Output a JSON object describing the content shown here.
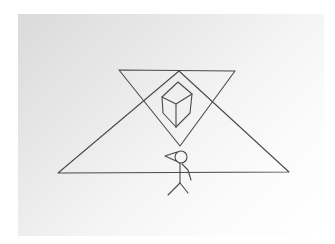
{
  "image": {
    "description": "Hand-drawn pencil sketch on paper",
    "width": 335,
    "height": 244,
    "colors": {
      "background": "#ffffff",
      "paper_shadow": "#dadada",
      "pencil": "#4a4a4a"
    },
    "elements": {
      "large_triangle": {
        "points": [
          [
            58,
            173
          ],
          [
            179,
            71
          ],
          [
            289,
            172
          ]
        ]
      },
      "inverted_triangle": {
        "points": [
          [
            119,
            70
          ],
          [
            235,
            71
          ],
          [
            180,
            146
          ]
        ]
      },
      "inner_diamond": {
        "points": [
          [
            179,
            71
          ],
          [
            211,
            101
          ],
          [
            180,
            146
          ],
          [
            137,
            101
          ]
        ]
      },
      "cube": {
        "top": [
          [
            178,
            82
          ],
          [
            192,
            94
          ],
          [
            176,
            104
          ],
          [
            162,
            97
          ]
        ],
        "left_face": [
          [
            162,
            97
          ],
          [
            176,
            104
          ],
          [
            176,
            127
          ],
          [
            163,
            113
          ]
        ],
        "right_face": [
          [
            176,
            104
          ],
          [
            192,
            94
          ],
          [
            190,
            113
          ],
          [
            176,
            127
          ]
        ]
      },
      "stick_figure": {
        "head": {
          "cx": 181,
          "cy": 157,
          "r": 6
        },
        "cone_tip": [
          165,
          156
        ],
        "body": [
          [
            180,
            163
          ],
          [
            180,
            183
          ]
        ],
        "arm": [
          [
            182,
            164
          ],
          [
            188,
            170
          ],
          [
            191,
            180
          ]
        ],
        "legs": [
          [
            [
              180,
              183
            ],
            [
              168,
              195
            ]
          ],
          [
            [
              180,
              183
            ],
            [
              188,
              193
            ]
          ]
        ]
      }
    }
  }
}
